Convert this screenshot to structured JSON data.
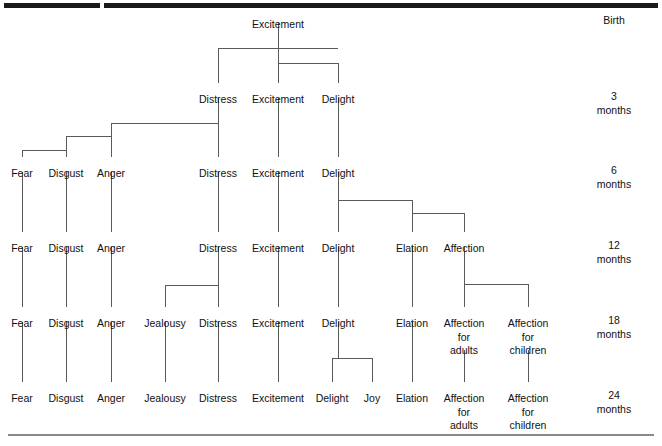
{
  "figure": {
    "line_color": "#5a5a5a",
    "text_color": "#111111",
    "rule_top_color": "#1a1a1a",
    "rule_bottom_color": "#8a8a8a"
  },
  "age_labels": [
    {
      "id": "age-birth",
      "lines": [
        "Birth"
      ],
      "x": 614,
      "y": 14
    },
    {
      "id": "age-3-months",
      "lines": [
        "3",
        "months"
      ],
      "x": 614,
      "y": 90
    },
    {
      "id": "age-6-months",
      "lines": [
        "6",
        "months"
      ],
      "x": 614,
      "y": 164
    },
    {
      "id": "age-12-months",
      "lines": [
        "12",
        "months"
      ],
      "x": 614,
      "y": 239
    },
    {
      "id": "age-18-months",
      "lines": [
        "18",
        "months"
      ],
      "x": 614,
      "y": 314
    },
    {
      "id": "age-24-months",
      "lines": [
        "24",
        "months"
      ],
      "x": 614,
      "y": 389
    }
  ],
  "rows": [
    {
      "id": "row-birth",
      "age": "Birth",
      "y": 18,
      "nodes": [
        {
          "id": "birth-excitement",
          "lines": [
            "Excitement"
          ],
          "x": 278
        }
      ]
    },
    {
      "id": "row-3-months",
      "age": "3 months",
      "y": 93,
      "nodes": [
        {
          "id": "m3-distress",
          "lines": [
            "Distress"
          ],
          "x": 218
        },
        {
          "id": "m3-excitement",
          "lines": [
            "Excitement"
          ],
          "x": 278
        },
        {
          "id": "m3-delight",
          "lines": [
            "Delight"
          ],
          "x": 338
        }
      ]
    },
    {
      "id": "row-6-months",
      "age": "6 months",
      "y": 167,
      "nodes": [
        {
          "id": "m6-fear",
          "lines": [
            "Fear"
          ],
          "x": 22
        },
        {
          "id": "m6-disgust",
          "lines": [
            "Disgust"
          ],
          "x": 66
        },
        {
          "id": "m6-anger",
          "lines": [
            "Anger"
          ],
          "x": 111
        },
        {
          "id": "m6-distress",
          "lines": [
            "Distress"
          ],
          "x": 218
        },
        {
          "id": "m6-excitement",
          "lines": [
            "Excitement"
          ],
          "x": 278
        },
        {
          "id": "m6-delight",
          "lines": [
            "Delight"
          ],
          "x": 338
        }
      ]
    },
    {
      "id": "row-12-months",
      "age": "12 months",
      "y": 242,
      "nodes": [
        {
          "id": "m12-fear",
          "lines": [
            "Fear"
          ],
          "x": 22
        },
        {
          "id": "m12-disgust",
          "lines": [
            "Disgust"
          ],
          "x": 66
        },
        {
          "id": "m12-anger",
          "lines": [
            "Anger"
          ],
          "x": 111
        },
        {
          "id": "m12-distress",
          "lines": [
            "Distress"
          ],
          "x": 218
        },
        {
          "id": "m12-excitement",
          "lines": [
            "Excitement"
          ],
          "x": 278
        },
        {
          "id": "m12-delight",
          "lines": [
            "Delight"
          ],
          "x": 338
        },
        {
          "id": "m12-elation",
          "lines": [
            "Elation"
          ],
          "x": 412
        },
        {
          "id": "m12-affection",
          "lines": [
            "Affection"
          ],
          "x": 464
        }
      ]
    },
    {
      "id": "row-18-months",
      "age": "18 months",
      "y": 317,
      "nodes": [
        {
          "id": "m18-fear",
          "lines": [
            "Fear"
          ],
          "x": 22
        },
        {
          "id": "m18-disgust",
          "lines": [
            "Disgust"
          ],
          "x": 66
        },
        {
          "id": "m18-anger",
          "lines": [
            "Anger"
          ],
          "x": 111
        },
        {
          "id": "m18-jealousy",
          "lines": [
            "Jealousy"
          ],
          "x": 165
        },
        {
          "id": "m18-distress",
          "lines": [
            "Distress"
          ],
          "x": 218
        },
        {
          "id": "m18-excitement",
          "lines": [
            "Excitement"
          ],
          "x": 278
        },
        {
          "id": "m18-delight",
          "lines": [
            "Delight"
          ],
          "x": 338
        },
        {
          "id": "m18-elation",
          "lines": [
            "Elation"
          ],
          "x": 412
        },
        {
          "id": "m18-affection-adults",
          "lines": [
            "Affection",
            "for",
            "adults"
          ],
          "x": 464
        },
        {
          "id": "m18-affection-children",
          "lines": [
            "Affection",
            "for",
            "children"
          ],
          "x": 528
        }
      ]
    },
    {
      "id": "row-24-months",
      "age": "24 months",
      "y": 392,
      "nodes": [
        {
          "id": "m24-fear",
          "lines": [
            "Fear"
          ],
          "x": 22
        },
        {
          "id": "m24-disgust",
          "lines": [
            "Disgust"
          ],
          "x": 66
        },
        {
          "id": "m24-anger",
          "lines": [
            "Anger"
          ],
          "x": 111
        },
        {
          "id": "m24-jealousy",
          "lines": [
            "Jealousy"
          ],
          "x": 165
        },
        {
          "id": "m24-distress",
          "lines": [
            "Distress"
          ],
          "x": 218
        },
        {
          "id": "m24-excitement",
          "lines": [
            "Excitement"
          ],
          "x": 278
        },
        {
          "id": "m24-delight",
          "lines": [
            "Delight"
          ],
          "x": 332
        },
        {
          "id": "m24-joy",
          "lines": [
            "Joy"
          ],
          "x": 372
        },
        {
          "id": "m24-elation",
          "lines": [
            "Elation"
          ],
          "x": 412
        },
        {
          "id": "m24-affection-adults",
          "lines": [
            "Affection",
            "for",
            "adults"
          ],
          "x": 464
        },
        {
          "id": "m24-affection-children",
          "lines": [
            "Affection",
            "for",
            "children"
          ],
          "x": 528
        }
      ]
    }
  ],
  "connectors": {
    "description": "Polyline paths in figure pixel coordinates joining parent emotions to the emotions they differentiate into.",
    "paths": [
      {
        "id": "conn-excitement-stem-birth",
        "d": "M 278 23 L 278 48"
      },
      {
        "id": "conn-birth-split-bar",
        "d": "M 218 48 L 338 48"
      },
      {
        "id": "conn-birth-to-m3-distress",
        "d": "M 218 48 L 218 83"
      },
      {
        "id": "conn-birth-to-m3-excitement",
        "d": "M 278 48 L 278 63"
      },
      {
        "id": "conn-birth-mid-bar",
        "d": "M 278 63 L 338 63"
      },
      {
        "id": "conn-birth-mid-excitement",
        "d": "M 278 63 L 278 83"
      },
      {
        "id": "conn-birth-to-m3-delight",
        "d": "M 338 63 L 338 83"
      },
      {
        "id": "conn-m3-distress-stem",
        "d": "M 218 98 L 218 123"
      },
      {
        "id": "conn-m3-distress-bar-anger",
        "d": "M 111 123 L 218 123"
      },
      {
        "id": "conn-m3-distress-to-m6",
        "d": "M 218 123 L 218 157"
      },
      {
        "id": "conn-anger-drop",
        "d": "M 111 123 L 111 157"
      },
      {
        "id": "conn-anger-bar-disgust",
        "d": "M 66 136 L 111 136"
      },
      {
        "id": "conn-disgust-drop",
        "d": "M 66 136 L 66 157"
      },
      {
        "id": "conn-disgust-bar-fear",
        "d": "M 22 150 L 66 150"
      },
      {
        "id": "conn-fear-drop",
        "d": "M 22 150 L 22 157"
      },
      {
        "id": "conn-m3-excitement-to-m6",
        "d": "M 278 98 L 278 157"
      },
      {
        "id": "conn-m3-delight-to-m6",
        "d": "M 338 98 L 338 157"
      },
      {
        "id": "conn-m6-fear-to-m12",
        "d": "M 22 172 L 22 232"
      },
      {
        "id": "conn-m6-disgust-to-m12",
        "d": "M 66 172 L 66 232"
      },
      {
        "id": "conn-m6-anger-to-m12",
        "d": "M 111 172 L 111 232"
      },
      {
        "id": "conn-m6-distress-to-m12",
        "d": "M 218 172 L 218 232"
      },
      {
        "id": "conn-m6-excitement-to-m12",
        "d": "M 278 172 L 278 232"
      },
      {
        "id": "conn-m6-delight-stem",
        "d": "M 338 172 L 338 200"
      },
      {
        "id": "conn-delight-split-bar",
        "d": "M 338 200 L 412 200"
      },
      {
        "id": "conn-m6-delight-to-m12",
        "d": "M 338 200 L 338 232"
      },
      {
        "id": "conn-elation-drop",
        "d": "M 412 200 L 412 213"
      },
      {
        "id": "conn-elation-bar-affection",
        "d": "M 412 213 L 464 213"
      },
      {
        "id": "conn-elation-drop2",
        "d": "M 412 213 L 412 232"
      },
      {
        "id": "conn-affection-drop",
        "d": "M 464 213 L 464 232"
      },
      {
        "id": "conn-m12-fear-to-m18",
        "d": "M 22 247 L 22 307"
      },
      {
        "id": "conn-m12-disgust-to-m18",
        "d": "M 66 247 L 66 307"
      },
      {
        "id": "conn-m12-anger-to-m18",
        "d": "M 111 247 L 111 307"
      },
      {
        "id": "conn-m12-distress-stem",
        "d": "M 218 247 L 218 285"
      },
      {
        "id": "conn-jealousy-bar",
        "d": "M 165 285 L 218 285"
      },
      {
        "id": "conn-m12-distress-to-m18",
        "d": "M 218 285 L 218 307"
      },
      {
        "id": "conn-jealousy-drop",
        "d": "M 165 285 L 165 307"
      },
      {
        "id": "conn-m12-excitement-to-m18",
        "d": "M 278 247 L 278 307"
      },
      {
        "id": "conn-m12-delight-to-m18",
        "d": "M 338 247 L 338 307"
      },
      {
        "id": "conn-m12-elation-to-m18",
        "d": "M 412 247 L 412 307"
      },
      {
        "id": "conn-m12-affection-stem",
        "d": "M 464 247 L 464 284"
      },
      {
        "id": "conn-affection-split-bar",
        "d": "M 464 284 L 528 284"
      },
      {
        "id": "conn-affection-adults-drop",
        "d": "M 464 284 L 464 307"
      },
      {
        "id": "conn-affection-children-drop",
        "d": "M 528 284 L 528 307"
      },
      {
        "id": "conn-m18-fear-to-m24",
        "d": "M 22 322 L 22 382"
      },
      {
        "id": "conn-m18-disgust-to-m24",
        "d": "M 66 322 L 66 382"
      },
      {
        "id": "conn-m18-anger-to-m24",
        "d": "M 111 322 L 111 382"
      },
      {
        "id": "conn-m18-jealousy-to-m24",
        "d": "M 165 322 L 165 382"
      },
      {
        "id": "conn-m18-distress-to-m24",
        "d": "M 218 322 L 218 382"
      },
      {
        "id": "conn-m18-excitement-to-m24",
        "d": "M 278 322 L 278 382"
      },
      {
        "id": "conn-m18-delight-stem",
        "d": "M 338 322 L 338 358"
      },
      {
        "id": "conn-joy-split-bar",
        "d": "M 332 358 L 372 358"
      },
      {
        "id": "conn-m18-delight-to-m24",
        "d": "M 332 358 L 332 382"
      },
      {
        "id": "conn-joy-drop",
        "d": "M 372 358 L 372 382"
      },
      {
        "id": "conn-m18-elation-to-m24",
        "d": "M 412 322 L 412 382"
      },
      {
        "id": "conn-m18-aff-adults-to-m24",
        "d": "M 464 350 L 464 382"
      },
      {
        "id": "conn-m18-aff-children-to-m24",
        "d": "M 528 350 L 528 382"
      }
    ]
  }
}
